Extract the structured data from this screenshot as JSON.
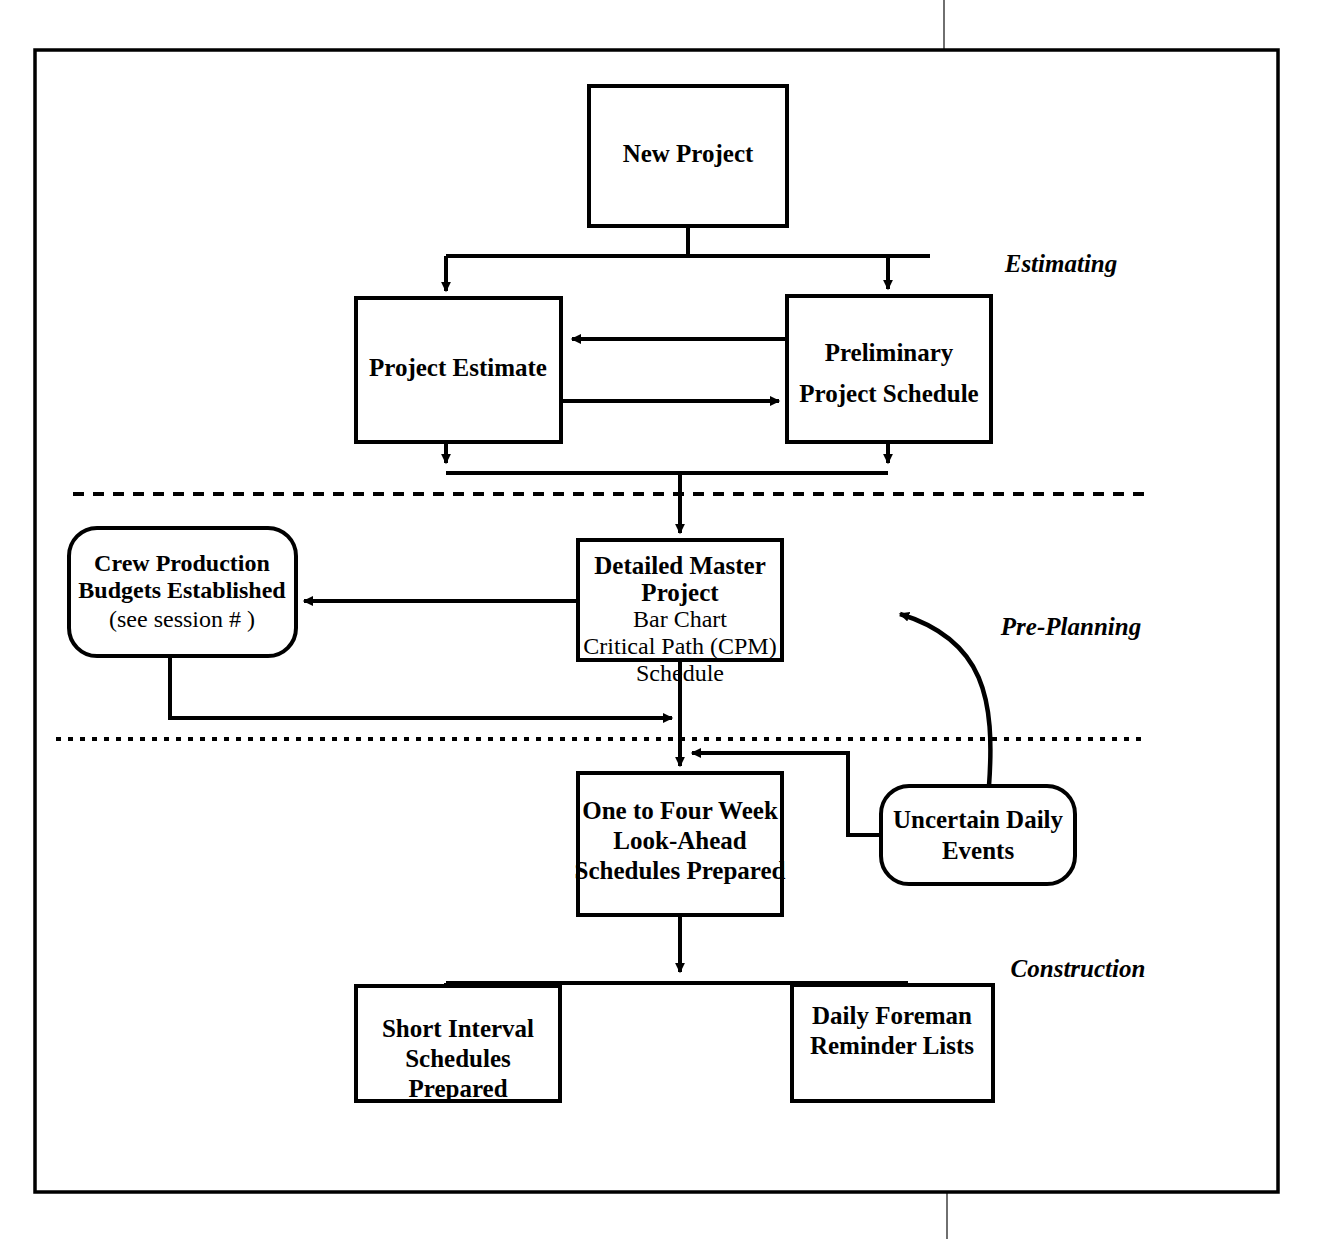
{
  "page": {
    "background_color": "#ffffff",
    "line_color": "#000000"
  },
  "phase_labels": [
    {
      "id": "estimating",
      "text": "Estimating",
      "x": 1061,
      "y": 266
    },
    {
      "id": "pre-planning",
      "text": "Pre-Planning",
      "x": 1071,
      "y": 629
    },
    {
      "id": "construction",
      "text": "Construction",
      "x": 1078,
      "y": 971
    }
  ],
  "nodes": [
    {
      "id": "new-project",
      "shape": "rect",
      "x": 589,
      "y": 86,
      "w": 198,
      "h": 140,
      "lines": [
        {
          "text": "New Project",
          "bold": true,
          "size": 25
        }
      ]
    },
    {
      "id": "project-estimate",
      "shape": "rect",
      "x": 356,
      "y": 298,
      "w": 205,
      "h": 144,
      "lines": [
        {
          "text": "Project Estimate",
          "bold": true,
          "size": 25
        }
      ]
    },
    {
      "id": "preliminary-project-schedule",
      "shape": "rect",
      "x": 787,
      "y": 296,
      "w": 204,
      "h": 146,
      "lines": [
        {
          "text": "Preliminary",
          "bold": true,
          "size": 25
        },
        {
          "text": "Project Schedule",
          "bold": true,
          "size": 25
        }
      ]
    },
    {
      "id": "detailed-master-project",
      "shape": "rect",
      "x": 578,
      "y": 540,
      "w": 204,
      "h": 120,
      "lines": [
        {
          "text": "Detailed Master",
          "bold": true,
          "size": 25
        },
        {
          "text": "Project",
          "bold": true,
          "size": 25
        },
        {
          "text": "Bar Chart",
          "bold": false,
          "size": 24
        },
        {
          "text": "Critical Path (CPM)",
          "bold": false,
          "size": 24
        },
        {
          "text": "Schedule",
          "bold": false,
          "size": 24
        }
      ]
    },
    {
      "id": "crew-production-budgets",
      "shape": "round",
      "x": 69,
      "y": 528,
      "w": 227,
      "h": 128,
      "radius": 28,
      "lines": [
        {
          "text": "Crew Production",
          "bold": true,
          "size": 24
        },
        {
          "text": "Budgets Established",
          "bold": true,
          "size": 24
        },
        {
          "text": "(see session #    )",
          "bold": false,
          "size": 24
        }
      ]
    },
    {
      "id": "one-to-four-week-look-ahead",
      "shape": "rect",
      "x": 578,
      "y": 773,
      "w": 204,
      "h": 142,
      "lines": [
        {
          "text": "One to Four Week",
          "bold": true,
          "size": 25
        },
        {
          "text": "Look-Ahead",
          "bold": true,
          "size": 25
        },
        {
          "text": "Schedules Prepared",
          "bold": true,
          "size": 25
        }
      ]
    },
    {
      "id": "uncertain-daily-events",
      "shape": "round",
      "x": 881,
      "y": 786,
      "w": 194,
      "h": 98,
      "radius": 28,
      "lines": [
        {
          "text": "Uncertain Daily",
          "bold": true,
          "size": 25
        },
        {
          "text": "Events",
          "bold": true,
          "size": 25
        }
      ]
    },
    {
      "id": "short-interval-schedules",
      "shape": "rect",
      "x": 356,
      "y": 986,
      "w": 204,
      "h": 115,
      "lines": [
        {
          "text": "Short Interval",
          "bold": true,
          "size": 25
        },
        {
          "text": "Schedules",
          "bold": true,
          "size": 25
        },
        {
          "text": "Prepared",
          "bold": true,
          "size": 25
        }
      ]
    },
    {
      "id": "daily-foreman-reminder-lists",
      "shape": "rect",
      "x": 792,
      "y": 985,
      "w": 201,
      "h": 116,
      "lines": [
        {
          "text": "Daily Foreman",
          "bold": true,
          "size": 25
        },
        {
          "text": "Reminder Lists",
          "bold": true,
          "size": 25
        }
      ]
    }
  ],
  "dividers": [
    {
      "id": "estimating-preplanning-divider",
      "x1": 73,
      "y1": 494,
      "x2": 1144,
      "y2": 494
    },
    {
      "id": "preplanning-construction-divider",
      "x1": 56,
      "y1": 739,
      "x2": 1142,
      "y2": 739
    }
  ],
  "connectors": [
    {
      "id": "new-project-to-split",
      "from": "new-project",
      "to": "project-estimate"
    },
    {
      "id": "new-project-to-preliminary",
      "from": "new-project",
      "to": "preliminary-project-schedule"
    },
    {
      "id": "preliminary-to-estimate",
      "from": "preliminary-project-schedule",
      "to": "project-estimate"
    },
    {
      "id": "estimate-to-preliminary",
      "from": "project-estimate",
      "to": "preliminary-project-schedule"
    },
    {
      "id": "estimate-down-merge",
      "from": "project-estimate",
      "to": "detailed-master-project"
    },
    {
      "id": "preliminary-down-merge",
      "from": "preliminary-project-schedule",
      "to": "detailed-master-project"
    },
    {
      "id": "master-to-crew-budgets",
      "from": "detailed-master-project",
      "to": "crew-production-budgets"
    },
    {
      "id": "crew-budgets-to-main-line",
      "from": "crew-production-budgets",
      "to": "detailed-master-project"
    },
    {
      "id": "master-to-lookahead",
      "from": "detailed-master-project",
      "to": "one-to-four-week-look-ahead"
    },
    {
      "id": "uncertain-to-master-curve",
      "from": "uncertain-daily-events",
      "to": "detailed-master-project"
    },
    {
      "id": "uncertain-to-lookahead",
      "from": "uncertain-daily-events",
      "to": "one-to-four-week-look-ahead"
    },
    {
      "id": "lookahead-to-short-interval",
      "from": "one-to-four-week-look-ahead",
      "to": "short-interval-schedules"
    },
    {
      "id": "lookahead-to-daily-foreman",
      "from": "one-to-four-week-look-ahead",
      "to": "daily-foreman-reminder-lists"
    }
  ],
  "page_border": {
    "x": 35,
    "y": 50,
    "w": 1243,
    "h": 1142
  }
}
